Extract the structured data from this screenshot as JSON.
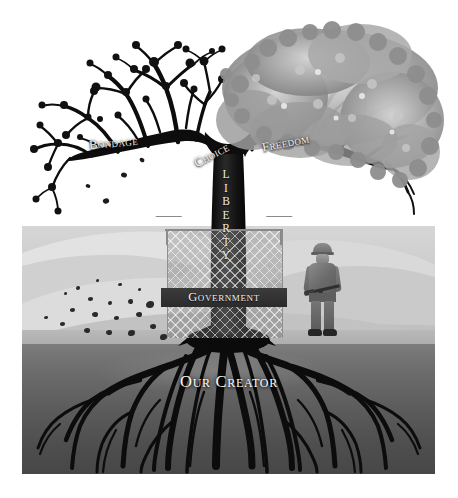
{
  "illustration": {
    "title": "Tree of Liberty",
    "alt_description": "Black and white illustration of a tree split between a dead bare half and a leafy living half, caged by a government fence, with roots labeled Our Creator and a soldier standing guard in a desert.",
    "palette": {
      "background": "#ffffff",
      "sand_light": "#e2e2e2",
      "sand_mid": "#cfcfcf",
      "sand_dark": "#b9b9b9",
      "underground_top": "#7c7c7c",
      "underground_bottom": "#474747",
      "tree_dark": "#111111",
      "foliage_gray": "#9a9a9a",
      "label_text": "#f4f2ea",
      "banner_dark": "#2f2f2f"
    }
  },
  "labels": {
    "bondage": "Bondage",
    "choice": "Choice",
    "freedom": "Freedom",
    "liberty_letters": [
      "L",
      "I",
      "B",
      "E",
      "R",
      "T",
      "Y"
    ],
    "government": "Government",
    "our_creator": "Our Creator"
  },
  "elements": {
    "dead_branch_side": "left",
    "living_foliage_side": "right",
    "cage_type": "chain-link fence with barbed wire",
    "figure": "soldier with helmet and rifle",
    "ground_line_label": "desert horizon",
    "root_system": "deep spreading roots"
  }
}
